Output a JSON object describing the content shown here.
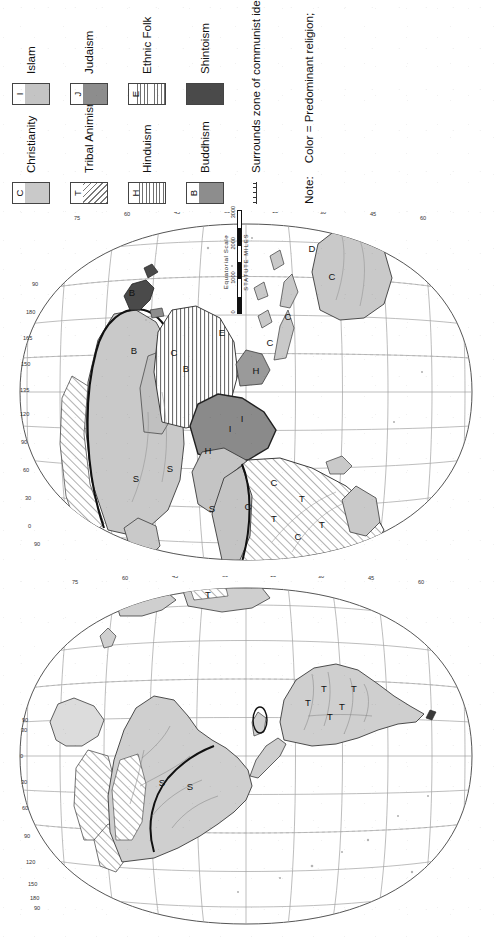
{
  "map": {
    "kind": "world-religions-map",
    "projection": "interrupted-homolosine-hemispheres",
    "hemispheres": [
      {
        "id": "west",
        "name": "Western Hemisphere"
      },
      {
        "id": "east",
        "name": "Eastern Hemisphere"
      }
    ],
    "longitude_labels_west": [
      "90",
      "180",
      "150",
      "120",
      "90",
      "60",
      "30",
      "0",
      "30",
      "90"
    ],
    "longitude_labels_east": [
      "90",
      "0",
      "30",
      "60",
      "90",
      "120",
      "135",
      "150",
      "165",
      "180",
      "90"
    ],
    "latitude_labels": [
      "75",
      "60",
      "45",
      "30",
      "15",
      "0",
      "15",
      "30",
      "45",
      "60",
      "75"
    ],
    "region_letters": [
      "S",
      "B",
      "C",
      "E",
      "H",
      "I",
      "J",
      "T",
      "D"
    ]
  },
  "scale": {
    "title": "Equatorial Scale",
    "ticks": [
      "0",
      "1000",
      "2000",
      "3000"
    ],
    "units": "STATUTE MILES"
  },
  "legend": {
    "rows": [
      {
        "left": {
          "letter": "C",
          "pattern": "solid-light",
          "label": "Christianity",
          "color": "#c9c9c9"
        },
        "right": {
          "letter": "I",
          "pattern": "solid-light",
          "label": "Islam",
          "color": "#c4c4c4"
        }
      },
      {
        "left": {
          "letter": "T",
          "pattern": "diagonal",
          "label": "Tribal Animism",
          "color": "#7a7a7a"
        },
        "right": {
          "letter": "J",
          "pattern": "solid-medium",
          "label": "Judaism",
          "color": "#8d8d8d"
        }
      },
      {
        "left": {
          "letter": "H",
          "pattern": "horizontal",
          "label": "Hinduism",
          "color": "#6f6f6f"
        },
        "right": {
          "letter": "E",
          "pattern": "horizontal",
          "label": "Ethnic Folk",
          "color": "#6f6f6f"
        }
      },
      {
        "left": {
          "letter": "B",
          "pattern": "solid-medium",
          "label": "Buddhism",
          "color": "#8d8d8d"
        },
        "right": {
          "letter": "",
          "pattern": "solid-dark",
          "label": "Shintoism",
          "color": "#4a4a4a"
        }
      }
    ],
    "communist_symbol_label": "Surrounds zone of communist ideology"
  },
  "footnote": {
    "prefix": "Note:",
    "color_key": "Color = Predominant religion;",
    "letter_key": "Letter = Significant minority element present"
  },
  "colors": {
    "christianity": "#c9c9c9",
    "islam": "#c4c4c4",
    "judaism": "#8d8d8d",
    "buddhism": "#8d8d8d",
    "hinduism": "#909090",
    "shintoism": "#4a4a4a",
    "tribal": "#7a7a7a",
    "ocean": "#ffffff",
    "graticule": "#9a9a9a",
    "outline": "#333333"
  }
}
